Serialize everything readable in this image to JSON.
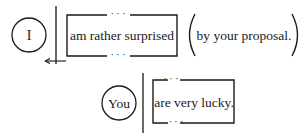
{
  "diagram": {
    "rows": [
      {
        "subject": "I",
        "predicate": "am rather surprised",
        "modifier": "by your proposal.",
        "has_arrow": true
      },
      {
        "subject": "You",
        "predicate": "are very lucky."
      }
    ],
    "ellipsis": "· · ·",
    "colors": {
      "ink": "#1a1a1a",
      "background": "#ffffff"
    }
  }
}
